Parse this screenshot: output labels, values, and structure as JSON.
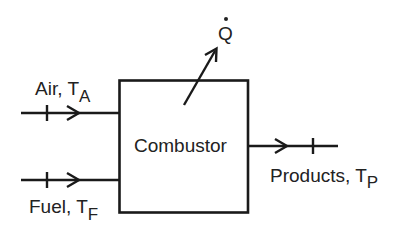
{
  "diagram": {
    "type": "control-volume block diagram",
    "block": {
      "label": "Combustor"
    },
    "inputs": [
      {
        "id": "air",
        "label": "Air, T",
        "subscript": "A",
        "direction": "in"
      },
      {
        "id": "fuel",
        "label": "Fuel, T",
        "subscript": "F",
        "direction": "in"
      }
    ],
    "outputs": [
      {
        "id": "products",
        "label": "Products, T",
        "subscript": "P",
        "direction": "out"
      }
    ],
    "heat": {
      "symbol": "Q",
      "accent": "˙",
      "description": "heat transfer rate (Q-dot) leaving combustor"
    },
    "colors": {
      "line": "#1a1a1a",
      "text": "#222222",
      "background": "#ffffff"
    }
  }
}
